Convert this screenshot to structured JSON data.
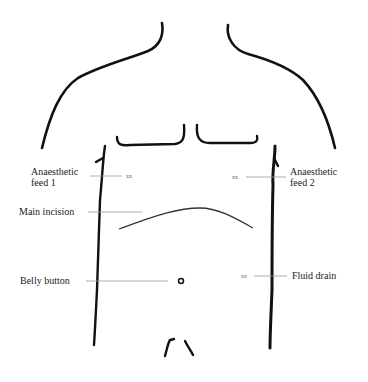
{
  "diagram": {
    "type": "torso-outline",
    "colors": {
      "outline": "#111111",
      "leader": "#9a9a9a",
      "text": "#222222"
    },
    "labels": {
      "anaesthetic_feed_1": {
        "line1": "Anaesthetic",
        "line2": "feed 1",
        "mark": "xx"
      },
      "anaesthetic_feed_2": {
        "line1": "Anaesthetic",
        "line2": "feed 2",
        "mark": "xx"
      },
      "main_incision": "Main incision",
      "belly_button": "Belly button",
      "fluid_drain": {
        "text": "Fluid drain",
        "mark": "xx"
      }
    }
  }
}
